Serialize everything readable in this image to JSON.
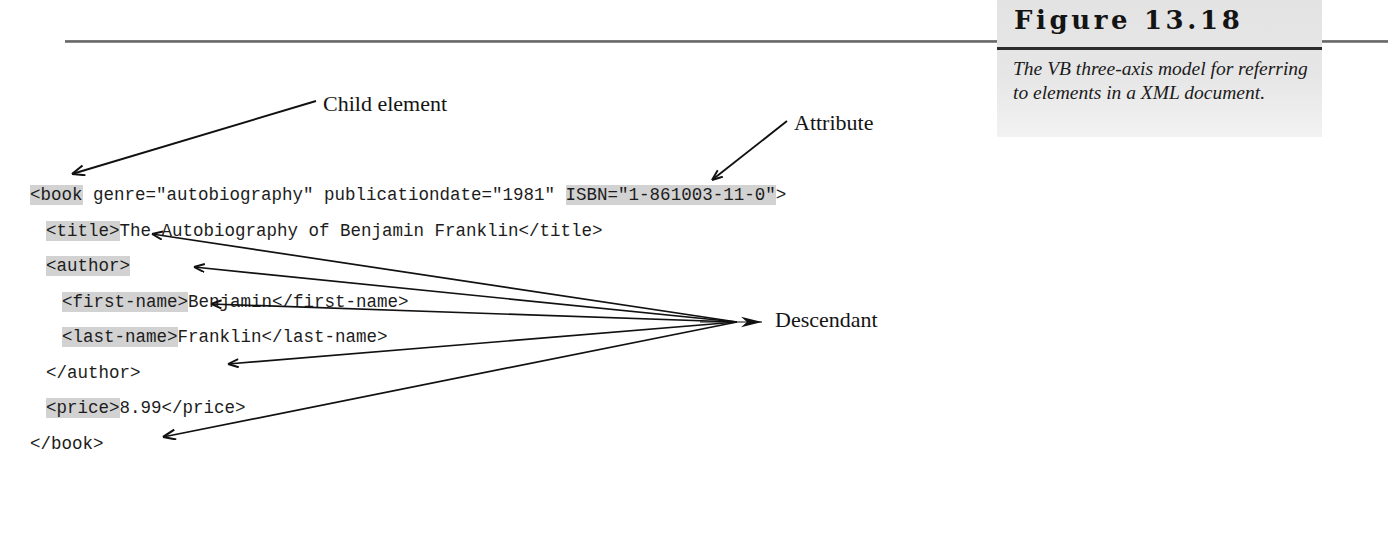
{
  "figure": {
    "title": "Figure 13.18",
    "caption": "The VB three-axis model for referring to elements in a XML document."
  },
  "code": {
    "lines": [
      {
        "indent": 0,
        "segments": [
          {
            "text": "<book",
            "highlight": true
          },
          {
            "text": " genre=\"autobiography\" publicationdate=\"1981\" ",
            "highlight": false
          },
          {
            "text": "ISBN=\"1-861003-11-0\"",
            "highlight": true
          },
          {
            "text": ">",
            "highlight": false
          }
        ]
      },
      {
        "indent": 1,
        "segments": [
          {
            "text": "<title>",
            "highlight": true
          },
          {
            "text": "The Autobiography of Benjamin Franklin</title>",
            "highlight": false
          }
        ]
      },
      {
        "indent": 1,
        "segments": [
          {
            "text": "<author>",
            "highlight": true
          }
        ]
      },
      {
        "indent": 2,
        "segments": [
          {
            "text": "<first-name>",
            "highlight": true
          },
          {
            "text": "Benjamin</first-name>",
            "highlight": false
          }
        ]
      },
      {
        "indent": 2,
        "segments": [
          {
            "text": "<last-name>",
            "highlight": true
          },
          {
            "text": "Franklin</last-name>",
            "highlight": false
          }
        ]
      },
      {
        "indent": 1,
        "segments": [
          {
            "text": "</author>",
            "highlight": false
          }
        ]
      },
      {
        "indent": 1,
        "segments": [
          {
            "text": "<price>",
            "highlight": true
          },
          {
            "text": "8.99</price>",
            "highlight": false
          }
        ]
      },
      {
        "indent": 0,
        "segments": [
          {
            "text": "</book>",
            "highlight": false
          }
        ]
      }
    ]
  },
  "annotations": {
    "child_element": "Child element",
    "attribute": "Attribute",
    "descendant": "Descendant"
  }
}
